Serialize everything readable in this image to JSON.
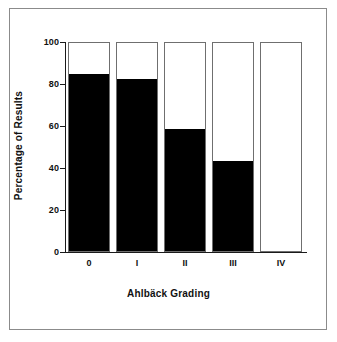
{
  "figure": {
    "background_color": "#ffffff",
    "frame_color": "#8b8b8b",
    "axis_color": "#1a1a1a",
    "bar_fill_color": "#000000",
    "bar_empty_color": "#ffffff",
    "bar_outline_color": "#6f6f6f"
  },
  "chart_data": {
    "type": "bar",
    "title": "",
    "subtitle": "",
    "xlabel": "Ahlbäck Grading",
    "ylabel": "Percentage of Results",
    "categories": [
      "0",
      "I",
      "II",
      "III",
      "IV"
    ],
    "ylim": [
      0,
      100
    ],
    "yticks": [
      0,
      20,
      40,
      60,
      80,
      100
    ],
    "ytick_labels": [
      "0",
      "20",
      "40",
      "60",
      "80",
      "100"
    ],
    "grid": false,
    "legend": null,
    "stacked": true,
    "series": [
      {
        "name": "filled",
        "color": "#000000",
        "values": [
          84.5,
          81.7,
          58.3,
          43.1,
          0
        ]
      },
      {
        "name": "unfilled",
        "color": "#ffffff",
        "values": [
          15.5,
          18.3,
          41.7,
          56.9,
          100
        ]
      }
    ],
    "annotations": []
  }
}
